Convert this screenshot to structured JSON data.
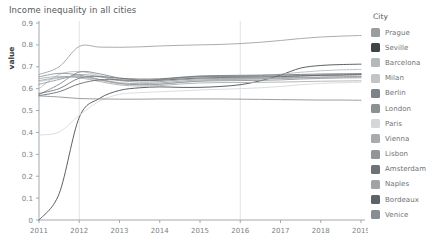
{
  "chart_data": {
    "type": "line",
    "title": "Income inequality in all cities",
    "xlabel": "Year",
    "ylabel": "value",
    "xlim": [
      2011,
      2019
    ],
    "ylim": [
      0,
      0.9
    ],
    "grid": "vertical gridlines at 2012 and 2016 only",
    "gridlines_x": [
      2012,
      2016
    ],
    "legend_position": "right",
    "legend_title": "City",
    "xticks": [
      "2011",
      "2012",
      "2013",
      "2014",
      "2015",
      "2016",
      "2017",
      "2018",
      "2019"
    ],
    "yticks": [
      "0",
      "0.1",
      "0.2",
      "0.3",
      "0.4",
      "0.5",
      "0.6",
      "0.7",
      "0.8",
      "0.9"
    ],
    "x": [
      2011,
      2011.5,
      2012,
      2012.5,
      2013,
      2013.5,
      2014,
      2014.5,
      2015,
      2015.5,
      2016,
      2016.5,
      2017,
      2017.5,
      2018,
      2018.5,
      2019
    ],
    "series": [
      {
        "name": "Prague",
        "color": "#9a9ea1",
        "values": [
          0.665,
          0.7,
          0.793,
          0.79,
          0.789,
          0.791,
          0.795,
          0.798,
          0.8,
          0.802,
          0.806,
          0.812,
          0.82,
          0.829,
          0.836,
          0.84,
          0.843
        ]
      },
      {
        "name": "Seville",
        "color": "#3f4447",
        "values": [
          0.0,
          0.12,
          0.469,
          0.555,
          0.592,
          0.604,
          0.608,
          0.606,
          0.606,
          0.61,
          0.618,
          0.636,
          0.662,
          0.694,
          0.706,
          0.71,
          0.712
        ]
      },
      {
        "name": "Barcelona",
        "color": "#b5b9bc",
        "values": [
          0.6,
          0.665,
          0.678,
          0.66,
          0.641,
          0.637,
          0.64,
          0.648,
          0.654,
          0.656,
          0.657,
          0.66,
          0.666,
          0.675,
          0.682,
          0.686,
          0.688
        ]
      },
      {
        "name": "Milan",
        "color": "#c1c5c8",
        "values": [
          0.632,
          0.648,
          0.652,
          0.638,
          0.622,
          0.618,
          0.621,
          0.629,
          0.636,
          0.64,
          0.643,
          0.646,
          0.65,
          0.656,
          0.661,
          0.664,
          0.666
        ]
      },
      {
        "name": "Berlin",
        "color": "#7e8387",
        "values": [
          0.573,
          0.62,
          0.676,
          0.668,
          0.648,
          0.64,
          0.642,
          0.65,
          0.655,
          0.656,
          0.656,
          0.657,
          0.658,
          0.66,
          0.662,
          0.663,
          0.664
        ]
      },
      {
        "name": "London",
        "color": "#8b9093",
        "values": [
          0.654,
          0.67,
          0.662,
          0.642,
          0.624,
          0.618,
          0.62,
          0.628,
          0.634,
          0.636,
          0.637,
          0.638,
          0.64,
          0.644,
          0.647,
          0.649,
          0.65
        ]
      },
      {
        "name": "Paris",
        "color": "#d4d7d9",
        "values": [
          0.388,
          0.402,
          0.478,
          0.543,
          0.574,
          0.582,
          0.586,
          0.59,
          0.594,
          0.597,
          0.6,
          0.604,
          0.61,
          0.618,
          0.624,
          0.627,
          0.629
        ]
      },
      {
        "name": "Vienna",
        "color": "#a7abae",
        "values": [
          0.646,
          0.656,
          0.65,
          0.633,
          0.617,
          0.612,
          0.614,
          0.621,
          0.626,
          0.628,
          0.628,
          0.629,
          0.63,
          0.632,
          0.634,
          0.635,
          0.636
        ]
      },
      {
        "name": "Lisbon",
        "color": "#929699",
        "values": [
          0.62,
          0.642,
          0.664,
          0.655,
          0.637,
          0.63,
          0.632,
          0.64,
          0.645,
          0.647,
          0.647,
          0.648,
          0.649,
          0.651,
          0.653,
          0.654,
          0.655
        ]
      },
      {
        "name": "Amsterdam",
        "color": "#6d7276",
        "values": [
          0.578,
          0.6,
          0.648,
          0.655,
          0.648,
          0.644,
          0.645,
          0.652,
          0.658,
          0.66,
          0.661,
          0.662,
          0.663,
          0.665,
          0.667,
          0.668,
          0.669
        ]
      },
      {
        "name": "Naples",
        "color": "#a0a4a7",
        "values": [
          0.637,
          0.651,
          0.656,
          0.642,
          0.627,
          0.623,
          0.626,
          0.634,
          0.64,
          0.642,
          0.643,
          0.644,
          0.646,
          0.649,
          0.652,
          0.654,
          0.656
        ]
      },
      {
        "name": "Bordeaux",
        "color": "#5e6367",
        "values": [
          0.568,
          0.586,
          0.622,
          0.64,
          0.64,
          0.637,
          0.638,
          0.644,
          0.649,
          0.651,
          0.652,
          0.653,
          0.655,
          0.658,
          0.661,
          0.662,
          0.664
        ]
      },
      {
        "name": "Venice",
        "color": "#888d91",
        "values": [
          0.567,
          0.562,
          0.555,
          0.553,
          0.552,
          0.552,
          0.553,
          0.553,
          0.553,
          0.553,
          0.552,
          0.551,
          0.55,
          0.549,
          0.548,
          0.548,
          0.547
        ]
      }
    ]
  },
  "legend": {
    "title": "City",
    "items": [
      {
        "label": "Prague",
        "color": "#9a9ea1"
      },
      {
        "label": "Seville",
        "color": "#3f4447"
      },
      {
        "label": "Barcelona",
        "color": "#b5b9bc"
      },
      {
        "label": "Milan",
        "color": "#c1c5c8"
      },
      {
        "label": "Berlin",
        "color": "#7e8387"
      },
      {
        "label": "London",
        "color": "#8b9093"
      },
      {
        "label": "Paris",
        "color": "#d4d7d9"
      },
      {
        "label": "Vienna",
        "color": "#a7abae"
      },
      {
        "label": "Lisbon",
        "color": "#929699"
      },
      {
        "label": "Amsterdam",
        "color": "#6d7276"
      },
      {
        "label": "Naples",
        "color": "#a0a4a7"
      },
      {
        "label": "Bordeaux",
        "color": "#5e6367"
      },
      {
        "label": "Venice",
        "color": "#888d91"
      }
    ]
  },
  "style": {
    "axis_color": "#9aa0a4",
    "grid_color": "#d8dcde",
    "tick_label_color": "#7a7f83",
    "title_color": "#555a5e"
  }
}
